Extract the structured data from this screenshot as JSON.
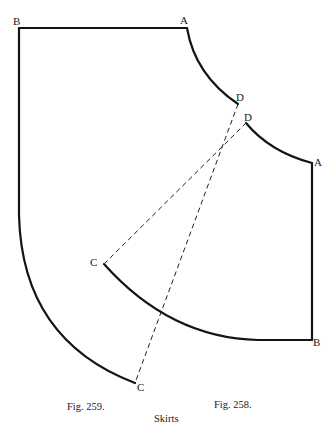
{
  "title": "Skirts",
  "figures": [
    {
      "id": "fig-259",
      "caption": "Fig. 259.",
      "points": {
        "B": "B",
        "A": "A",
        "D": "D",
        "C": "C"
      }
    },
    {
      "id": "fig-258",
      "caption": "Fig. 258.",
      "points": {
        "D": "D",
        "A": "A",
        "B": "B",
        "C": "C"
      }
    }
  ],
  "colors": {
    "line": "#141414",
    "background": "#ffffff"
  }
}
